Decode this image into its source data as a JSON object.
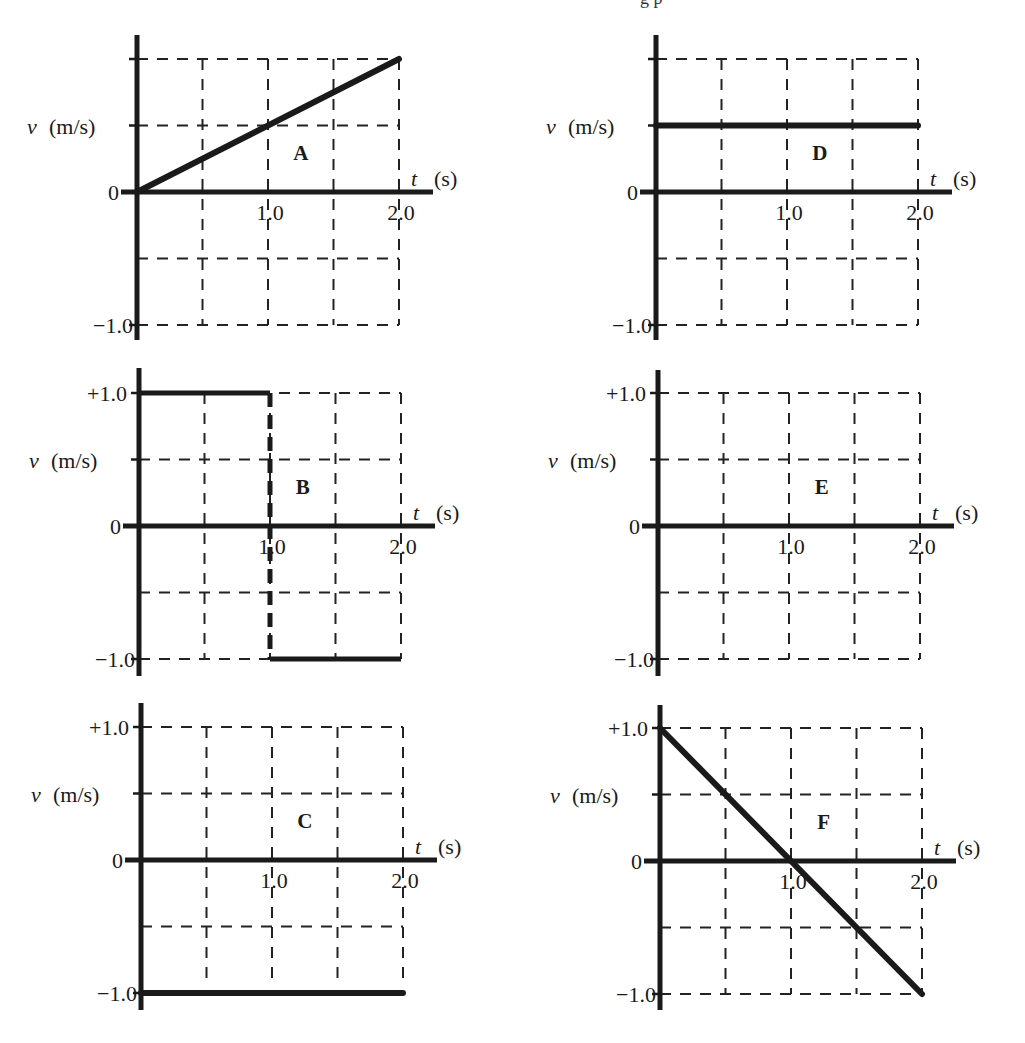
{
  "header_fragment": "g p",
  "chart_data": [
    {
      "id": "A",
      "type": "line",
      "title": "A",
      "xlabel": "t (s)",
      "ylabel": "v (m/s)",
      "xlim": [
        0,
        2.2
      ],
      "ylim": [
        -1.0,
        1.0
      ],
      "x_ticks": [
        0.5,
        1.0,
        1.5,
        2.0
      ],
      "x_tick_labels": [
        "1.0",
        "2.0"
      ],
      "y_tick_labels": [
        "0",
        "-1.0"
      ],
      "grid": "dashed",
      "series": [
        {
          "name": "A",
          "x": [
            0,
            2.0
          ],
          "y": [
            0,
            1.0
          ]
        }
      ]
    },
    {
      "id": "B",
      "type": "line",
      "title": "B",
      "xlabel": "t (s)",
      "ylabel": "v (m/s)",
      "xlim": [
        0,
        2.2
      ],
      "ylim": [
        -1.0,
        1.0
      ],
      "x_tick_labels": [
        "1.0",
        "2.0"
      ],
      "y_tick_labels": [
        "+1.0",
        "0",
        "-1.0"
      ],
      "grid": "dashed",
      "series": [
        {
          "name": "B",
          "x": [
            0,
            1.0,
            1.0,
            2.0
          ],
          "y": [
            1.0,
            1.0,
            -1.0,
            -1.0
          ]
        }
      ]
    },
    {
      "id": "C",
      "type": "line",
      "title": "C",
      "xlabel": "t (s)",
      "ylabel": "v (m/s)",
      "xlim": [
        0,
        2.2
      ],
      "ylim": [
        -1.0,
        1.0
      ],
      "x_tick_labels": [
        "1.0",
        "2.0"
      ],
      "y_tick_labels": [
        "+1.0",
        "0",
        "-1.0"
      ],
      "grid": "dashed",
      "series": [
        {
          "name": "C",
          "x": [
            0,
            2.0
          ],
          "y": [
            -1.0,
            -1.0
          ]
        }
      ]
    },
    {
      "id": "D",
      "type": "line",
      "title": "D",
      "xlabel": "t (s)",
      "ylabel": "v (m/s)",
      "xlim": [
        0,
        2.2
      ],
      "ylim": [
        -1.0,
        1.0
      ],
      "x_tick_labels": [
        "1.0",
        "2.0"
      ],
      "y_tick_labels": [
        "0",
        "-1.0"
      ],
      "grid": "dashed",
      "series": [
        {
          "name": "D",
          "x": [
            0,
            2.0
          ],
          "y": [
            0.5,
            0.5
          ]
        }
      ]
    },
    {
      "id": "E",
      "type": "line",
      "title": "E",
      "xlabel": "t (s)",
      "ylabel": "v (m/s)",
      "xlim": [
        0,
        2.2
      ],
      "ylim": [
        -1.0,
        1.0
      ],
      "x_tick_labels": [
        "1.0",
        "2.0"
      ],
      "y_tick_labels": [
        "+1.0",
        "0",
        "-1.0"
      ],
      "grid": "dashed",
      "series": [
        {
          "name": "E",
          "x": [
            0,
            2.0
          ],
          "y": [
            0,
            0
          ]
        }
      ]
    },
    {
      "id": "F",
      "type": "line",
      "title": "F",
      "xlabel": "t (s)",
      "ylabel": "v (m/s)",
      "xlim": [
        0,
        2.2
      ],
      "ylim": [
        -1.0,
        1.0
      ],
      "x_tick_labels": [
        "1.0",
        "2.0"
      ],
      "y_tick_labels": [
        "+1.0",
        "0",
        "-1.0"
      ],
      "grid": "dashed",
      "series": [
        {
          "name": "F",
          "x": [
            0,
            2.0
          ],
          "y": [
            1.0,
            -1.0
          ]
        }
      ]
    }
  ],
  "labels": {
    "v": "v",
    "unit_v": "(m/s)",
    "t": "t",
    "unit_t": "(s)"
  },
  "panel_layout": [
    {
      "id": "A",
      "ox": 137,
      "zy": 192,
      "top": 35,
      "bottom": 340,
      "show_top_label": false
    },
    {
      "id": "B",
      "ox": 139,
      "zy": 526,
      "top": 368,
      "bottom": 676,
      "show_top_label": true
    },
    {
      "id": "C",
      "ox": 141,
      "zy": 860,
      "top": 703,
      "bottom": 1010,
      "show_top_label": true
    },
    {
      "id": "D",
      "ox": 656,
      "zy": 192,
      "top": 35,
      "bottom": 340,
      "show_top_label": false
    },
    {
      "id": "E",
      "ox": 658,
      "zy": 526,
      "top": 370,
      "bottom": 676,
      "show_top_label": true
    },
    {
      "id": "F",
      "ox": 660,
      "zy": 861,
      "top": 705,
      "bottom": 1010,
      "show_top_label": true
    }
  ],
  "colors": {
    "ink": "#1a1a1a",
    "grid": "#222222",
    "background": "#ffffff"
  }
}
